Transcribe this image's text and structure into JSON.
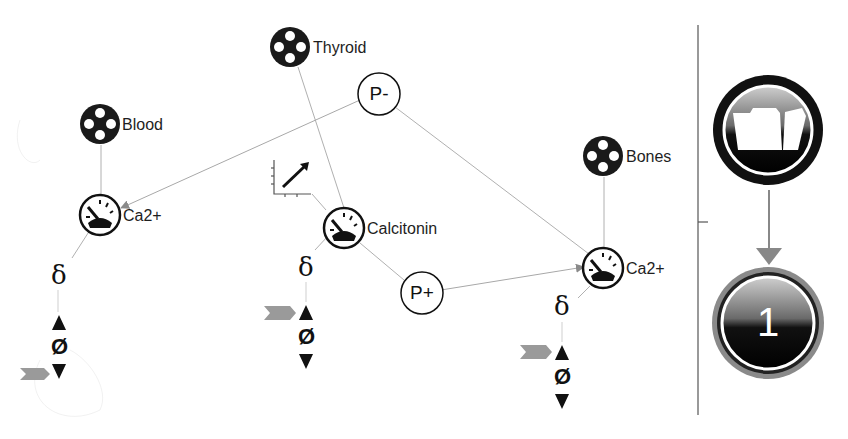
{
  "diagram": {
    "compartments": [
      {
        "id": "blood",
        "label": "Blood"
      },
      {
        "id": "thyroid",
        "label": "Thyroid"
      },
      {
        "id": "bones",
        "label": "Bones"
      }
    ],
    "species": [
      {
        "id": "ca_blood",
        "label": "Ca2+",
        "compartment": "Blood"
      },
      {
        "id": "calcitonin",
        "label": "Calcitonin",
        "compartment": "Thyroid"
      },
      {
        "id": "ca_bones",
        "label": "Ca2+",
        "compartment": "Bones"
      }
    ],
    "processes": [
      {
        "id": "p_minus",
        "label": "P-"
      },
      {
        "id": "p_plus",
        "label": "P+"
      }
    ],
    "degradation": {
      "delta_symbol": "δ",
      "sink_symbol": "Ø"
    },
    "edges": [
      {
        "from": "P-",
        "to": "Ca2+ (Blood)",
        "arrow": true
      },
      {
        "from": "P-",
        "to": "Ca2+ (Bones)",
        "arrow": false
      },
      {
        "from": "Calcitonin",
        "to": "P+",
        "arrow": false
      },
      {
        "from": "P+",
        "to": "Ca2+ (Bones)",
        "arrow": true
      },
      {
        "from": "Thyroid",
        "to": "Calcitonin",
        "arrow": false
      },
      {
        "from": "Blood",
        "to": "Ca2+ (Blood)",
        "arrow": false
      },
      {
        "from": "Bones",
        "to": "Ca2+ (Bones)",
        "arrow": false
      }
    ],
    "plot_icon": "line-chart-icon"
  },
  "sidebar": {
    "folder_icon": "folder-icon",
    "step_number": "1"
  },
  "colors": {
    "node_fill": "#1a1a1a",
    "edge": "#a8a8a8",
    "arrowhead": "#8a8a8a",
    "gray_arrow": "#9a9a9a",
    "divider": "#555555"
  }
}
